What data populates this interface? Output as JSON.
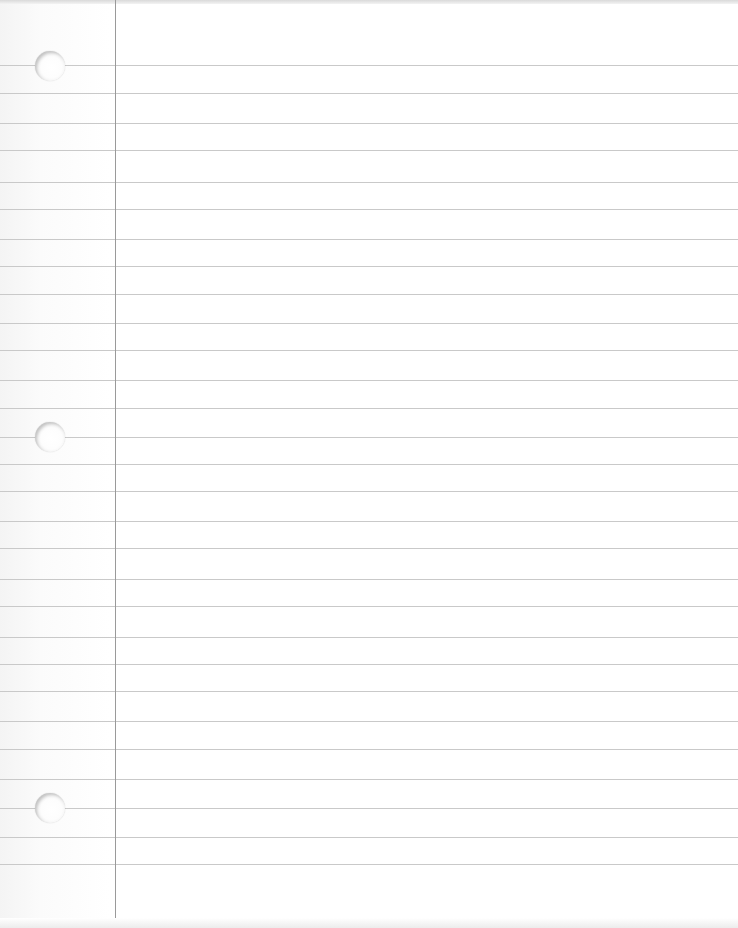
{
  "paper": {
    "type": "lined notebook paper",
    "width": 738,
    "height": 928,
    "background_color": "#ffffff",
    "rule_color": "#c9c9c9",
    "margin_line_color": "#9a9a9a",
    "margin_line_x": 115,
    "rule_y_positions": [
      65,
      93,
      123,
      150,
      182,
      209,
      239,
      266,
      294,
      323,
      350,
      380,
      408,
      437,
      464,
      491,
      521,
      548,
      579,
      606,
      637,
      664,
      691,
      721,
      749,
      779,
      808,
      837,
      864
    ],
    "holes": [
      {
        "cx": 50,
        "cy": 66,
        "r": 15
      },
      {
        "cx": 50,
        "cy": 437,
        "r": 15
      },
      {
        "cx": 50,
        "cy": 808,
        "r": 15
      }
    ]
  }
}
